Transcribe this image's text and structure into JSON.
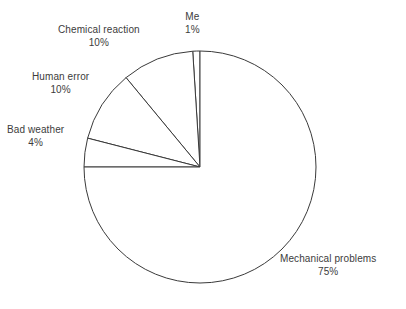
{
  "chart_data": {
    "type": "pie",
    "title": "",
    "subtitle": "",
    "xlabel": "",
    "ylabel": "",
    "legend_position": "none",
    "grid": false,
    "label_format": "name and percent outside slices",
    "start_angle_deg": 90,
    "direction": "counterclockwise",
    "center": {
      "x": 200,
      "y": 167
    },
    "radius": 116,
    "categories": [
      "Me",
      "Chemical reaction",
      "Human error",
      "Bad weather",
      "Mechanical problems"
    ],
    "values": [
      1,
      10,
      10,
      4,
      75
    ],
    "percent_labels": [
      "1%",
      "10%",
      "10%",
      "4%",
      "75%"
    ],
    "slices": [
      {
        "name": "Me",
        "value": 1,
        "percent_label": "1%",
        "start_deg": 90,
        "end_deg": 93.6,
        "fill": "#ffffff",
        "stroke": "#3a3a3a"
      },
      {
        "name": "Chemical reaction",
        "value": 10,
        "percent_label": "10%",
        "start_deg": 93.6,
        "end_deg": 129.6,
        "fill": "#ffffff",
        "stroke": "#3a3a3a"
      },
      {
        "name": "Human error",
        "value": 10,
        "percent_label": "10%",
        "start_deg": 129.6,
        "end_deg": 165.6,
        "fill": "#ffffff",
        "stroke": "#3a3a3a"
      },
      {
        "name": "Bad weather",
        "value": 4,
        "percent_label": "4%",
        "start_deg": 165.6,
        "end_deg": 180,
        "fill": "#ffffff",
        "stroke": "#3a3a3a"
      },
      {
        "name": "Mechanical problems",
        "value": 75,
        "percent_label": "75%",
        "start_deg": 180,
        "end_deg": 450,
        "fill": "#ffffff",
        "stroke": "#3a3a3a"
      }
    ]
  },
  "labels": {
    "chemical_reaction": {
      "name": "Chemical reaction",
      "value": "10%"
    },
    "me": {
      "name": "Me",
      "value": "1%"
    },
    "human_error": {
      "name": "Human error",
      "value": "10%"
    },
    "bad_weather": {
      "name": "Bad weather",
      "value": "4%"
    },
    "mechanical_problems": {
      "name": "Mechanical problems",
      "value": "75%"
    }
  },
  "colors": {
    "background": "#ffffff",
    "slice_fill": "#ffffff",
    "slice_stroke": "#3a3a3a",
    "text": "#3c3c3c"
  }
}
